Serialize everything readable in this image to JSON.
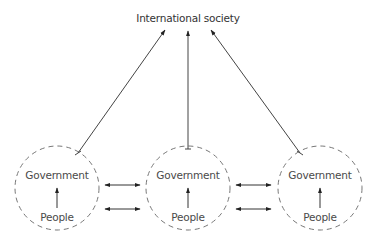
{
  "diagram": {
    "top_node": {
      "label": "International society"
    },
    "states": [
      {
        "id": "state-left",
        "government_label": "Government",
        "people_label": "People"
      },
      {
        "id": "state-middle",
        "government_label": "Government",
        "people_label": "People"
      },
      {
        "id": "state-right",
        "government_label": "Government",
        "people_label": "People"
      }
    ],
    "edges": [
      {
        "from": "state-left",
        "to": "top_node",
        "type": "arrow"
      },
      {
        "from": "state-middle",
        "to": "top_node",
        "type": "arrow"
      },
      {
        "from": "state-right",
        "to": "top_node",
        "type": "arrow"
      },
      {
        "from": "People",
        "to": "Government",
        "type": "arrow",
        "within": "each-state"
      },
      {
        "between": [
          "state-left",
          "state-middle"
        ],
        "type": "double-arrow",
        "count": 2
      },
      {
        "between": [
          "state-middle",
          "state-right"
        ],
        "type": "double-arrow",
        "count": 2
      }
    ],
    "colors": {
      "line": "#333333",
      "dashed_circle": "#777777",
      "text": "#4a4a4a"
    }
  }
}
